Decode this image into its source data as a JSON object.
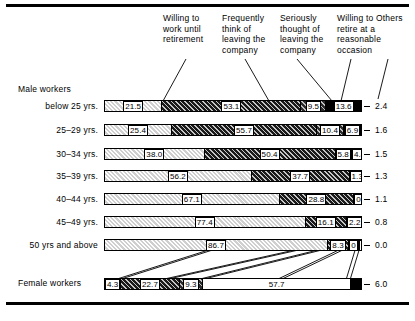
{
  "chart_data": {
    "type": "bar",
    "subtype": "stacked-horizontal-percent",
    "title": "",
    "xlabel": "",
    "ylabel": "",
    "xlim": [
      0,
      100
    ],
    "grid": false,
    "legend_position": "top",
    "categories": [
      "below 25 yrs.",
      "25–29  yrs.",
      "30–34  yrs.",
      "35–39  yrs.",
      "40–44  yrs.",
      "45–49  yrs.",
      "50 yrs and above",
      "Female workers"
    ],
    "series": [
      {
        "name": "Willing to work until retirement",
        "values": [
          21.5,
          25.4,
          38.0,
          56.2,
          67.1,
          77.4,
          86.7,
          4.3
        ]
      },
      {
        "name": "Frequently think of leaving the company",
        "values": [
          53.1,
          55.7,
          50.4,
          37.7,
          28.8,
          16.1,
          8.3,
          22.7
        ]
      },
      {
        "name": "Seriously thought of leaving the company",
        "values": [
          9.5,
          10.4,
          5.8,
          1.3,
          0.7,
          2.2,
          0.0,
          9.3
        ]
      },
      {
        "name": "Willing to retire at a reasonable occasion",
        "values": [
          13.6,
          6.9,
          4.4,
          3.5,
          2.3,
          3.6,
          5.0,
          57.7
        ]
      },
      {
        "name": "Others",
        "values": [
          2.4,
          1.6,
          1.5,
          1.3,
          1.1,
          0.8,
          0.0,
          6.0
        ]
      }
    ]
  },
  "header": {
    "columns": [
      "Willing to work until retirement",
      "Frequently think of leaving the company",
      "Seriously thought of leaving the company",
      "Willing to retire at a reasonable occasion",
      "Others"
    ]
  },
  "groups": {
    "male": "Male workers",
    "female": "Female workers"
  },
  "rows": [
    {
      "label": "below 25 yrs.",
      "segments": [
        {
          "value": "21.5",
          "pattern": "light-hatch"
        },
        {
          "value": "53.1",
          "pattern": "dark-hatch"
        },
        {
          "value": "9.5",
          "pattern": "dark-hatch-2"
        },
        {
          "value": "13.6",
          "pattern": "solid-black"
        }
      ],
      "others": "2.4"
    },
    {
      "label": "25–29  yrs.",
      "segments": [
        {
          "value": "25.4",
          "pattern": "light-hatch"
        },
        {
          "value": "55.7",
          "pattern": "dark-hatch"
        },
        {
          "value": "10.4",
          "pattern": "dark-hatch-2"
        },
        {
          "value": "6.9",
          "pattern": "solid-black"
        }
      ],
      "others": "1.6"
    },
    {
      "label": "30–34  yrs.",
      "segments": [
        {
          "value": "38.0",
          "pattern": "light-hatch"
        },
        {
          "value": "50.4",
          "pattern": "dark-hatch"
        },
        {
          "value": "5.8",
          "pattern": "dark-hatch-2"
        },
        {
          "value": "4.4",
          "pattern": "solid-black"
        }
      ],
      "others": "1.5"
    },
    {
      "label": "35–39  yrs.",
      "segments": [
        {
          "value": "56.2",
          "pattern": "light-hatch"
        },
        {
          "value": "37.7",
          "pattern": "dark-hatch"
        },
        {
          "value": "1.3",
          "pattern": "dark-hatch-2"
        },
        {
          "value": "3.5",
          "pattern": "solid-black"
        }
      ],
      "others": "1.3"
    },
    {
      "label": "40–44  yrs.",
      "segments": [
        {
          "value": "67.1",
          "pattern": "light-hatch"
        },
        {
          "value": "28.8",
          "pattern": "dark-hatch"
        },
        {
          "value": "0.7",
          "pattern": "dark-hatch-2"
        },
        {
          "value": "2.3",
          "pattern": "solid-black"
        }
      ],
      "others": "1.1"
    },
    {
      "label": "45–49  yrs.",
      "segments": [
        {
          "value": "77.4",
          "pattern": "light-hatch"
        },
        {
          "value": "16.1",
          "pattern": "dark-hatch"
        },
        {
          "value": "2.2",
          "pattern": "dark-hatch-2"
        },
        {
          "value": "3.6",
          "pattern": "solid-black"
        }
      ],
      "others": "0.8"
    },
    {
      "label": "50 yrs and above",
      "segments": [
        {
          "value": "86.7",
          "pattern": "light-hatch"
        },
        {
          "value": "8.3",
          "pattern": "dark-hatch"
        },
        {
          "value": "0",
          "pattern": "dark-hatch-2"
        },
        {
          "value": "5.0",
          "pattern": "solid-black"
        }
      ],
      "others": "0.0"
    },
    {
      "label": "Female workers",
      "segments": [
        {
          "value": "4.3",
          "pattern": "light-hatch"
        },
        {
          "value": "22.7",
          "pattern": "dark-hatch"
        },
        {
          "value": "9.3",
          "pattern": "dark-hatch-2"
        },
        {
          "value": "57.7",
          "pattern": "white"
        },
        {
          "value": "",
          "pattern": "solid-black"
        }
      ],
      "others": "6.0"
    }
  ]
}
